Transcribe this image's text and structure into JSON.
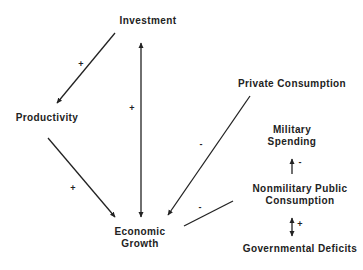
{
  "diagram": {
    "nodes": {
      "investment": {
        "label": "Investment"
      },
      "productivity": {
        "label": "Productivity"
      },
      "economic_growth": {
        "line1": "Economic",
        "line2": "Growth"
      },
      "private_consumption": {
        "label": "Private Consumption"
      },
      "military_spending": {
        "line1": "Military",
        "line2": "Spending"
      },
      "nonmilitary_public_consumption": {
        "line1": "Nonmilitary Public",
        "line2": "Consumption"
      },
      "governmental_deficits": {
        "label": "Governmental Deficits"
      }
    },
    "edges": [
      {
        "from": "Investment",
        "to": "Productivity",
        "sign": "+"
      },
      {
        "from": "Investment",
        "to": "Economic Growth",
        "sign": "+",
        "bidirectional": true
      },
      {
        "from": "Productivity",
        "to": "Economic Growth",
        "sign": "+"
      },
      {
        "from": "Private Consumption",
        "to": "Economic Growth",
        "sign": "-"
      },
      {
        "from": "Nonmilitary Public Consumption",
        "to": "Economic Growth",
        "sign": "-"
      },
      {
        "from": "Nonmilitary Public Consumption",
        "to": "Military Spending",
        "sign": "-"
      },
      {
        "from": "Nonmilitary Public Consumption",
        "to": "Governmental Deficits",
        "sign": "+",
        "bidirectional": true
      }
    ],
    "signs": {
      "inv_prod": "+",
      "inv_growth": "+",
      "prod_growth": "+",
      "priv_growth": "-",
      "nonmil_growth": "-",
      "nonmil_military": "-",
      "nonmil_deficits": "+"
    }
  }
}
